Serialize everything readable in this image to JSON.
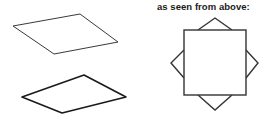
{
  "figure": {
    "title_caption": "as seen from above:",
    "background_color": "#ffffff",
    "stroke_color": "#333333",
    "stroke_color_dark": "#1a1a1a",
    "width": 273,
    "height": 120
  },
  "left_panel": {
    "name": "perspective-views",
    "shapes": [
      {
        "name": "upper-parallelogram",
        "description": "flat square sheet seen in perspective, thin outline",
        "points": "13,26 80,14 118,42 54,54",
        "stroke_width": 1,
        "stroke": "#3a3a3a",
        "fill": "none"
      },
      {
        "name": "lower-parallelogram",
        "description": "flat square sheet seen in perspective, thicker outline",
        "points": "22,97 84,75 126,97 62,113",
        "stroke_width": 1.6,
        "stroke": "#1a1a1a",
        "fill": "none"
      }
    ]
  },
  "right_panel": {
    "name": "top-down-view",
    "caption": "as seen from above:",
    "square": {
      "name": "center-square",
      "x": 44,
      "y": 30,
      "width": 62,
      "height": 65,
      "stroke": "#333333",
      "stroke_width": 1.4,
      "fill": "none"
    },
    "flaps": [
      {
        "name": "top-flap-triangle",
        "points": "58,30 75,18 92,30",
        "stroke": "#333333",
        "stroke_width": 1.4
      },
      {
        "name": "right-flap-triangle",
        "points": "106,50 118,63 106,78",
        "stroke": "#333333",
        "stroke_width": 1.4
      },
      {
        "name": "bottom-flap-triangle",
        "points": "58,95 75,110 92,95",
        "stroke": "#333333",
        "stroke_width": 1.4
      },
      {
        "name": "left-flap-triangle",
        "points": "44,50 31,63 44,78",
        "stroke": "#333333",
        "stroke_width": 1.4
      }
    ]
  }
}
